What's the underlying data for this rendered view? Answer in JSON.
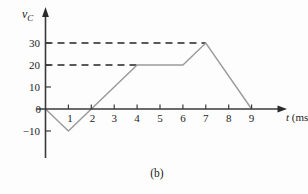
{
  "figure": {
    "caption": "(b)",
    "y_axis_label_main": "v",
    "y_axis_label_sub": "C",
    "x_axis_label_var": "t",
    "x_axis_label_unit": " (ms)"
  },
  "chart_data": {
    "type": "line",
    "title": "",
    "xlabel": "t (ms)",
    "ylabel": "vC",
    "xlim": [
      0,
      10
    ],
    "ylim": [
      -15,
      35
    ],
    "grid": false,
    "x_tick_labels": [
      "1",
      "2",
      "3",
      "4",
      "5",
      "6",
      "7",
      "8",
      "9"
    ],
    "y_tick_labels": [
      "30",
      "20",
      "10",
      "0",
      "−10"
    ],
    "y_tick_values": [
      30,
      20,
      10,
      0,
      -10
    ],
    "points": [
      {
        "t": 0,
        "v": 0
      },
      {
        "t": 1,
        "v": -10
      },
      {
        "t": 4,
        "v": 20
      },
      {
        "t": 6,
        "v": 20
      },
      {
        "t": 7,
        "v": 30
      },
      {
        "t": 9,
        "v": 0
      }
    ],
    "dashed_guides": [
      {
        "v": 30,
        "t_start": 0,
        "t_end": 7
      },
      {
        "v": 20,
        "t_start": 0,
        "t_end": 4
      }
    ],
    "line_color": "#9a9a9a",
    "dash_color": "#242424",
    "axis_color": "#3a3a3a"
  }
}
